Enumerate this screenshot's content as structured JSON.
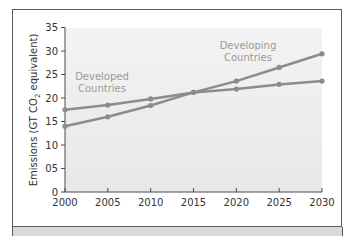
{
  "chart_data": {
    "type": "line",
    "title": "",
    "xlabel": "",
    "ylabel": "Emissions (GT CO₂ equivalent)",
    "ylabel_parts": {
      "prefix": "Emissions (GT CO",
      "sub": "2",
      "suffix": " equivalent)"
    },
    "x": [
      2000,
      2005,
      2010,
      2015,
      2020,
      2025,
      2030
    ],
    "x_tick_labels": [
      "2000",
      "2005",
      "2010",
      "2015",
      "2020",
      "2025",
      "2030"
    ],
    "y_ticks": [
      0,
      5,
      10,
      15,
      20,
      25,
      30,
      35
    ],
    "y_tick_labels": [
      "0",
      "05",
      "10",
      "15",
      "20",
      "25",
      "30",
      "35"
    ],
    "ylim": [
      0,
      35
    ],
    "xlim": [
      2000,
      2030
    ],
    "grid": false,
    "legend": "inline annotations",
    "series": [
      {
        "name": "Developed Countries",
        "label_lines": [
          "Developed",
          "Countries"
        ],
        "values": [
          17.5,
          18.5,
          19.8,
          21.2,
          21.9,
          22.9,
          23.6
        ],
        "color": "#8c8c8c"
      },
      {
        "name": "Developing Countries",
        "label_lines": [
          "Developing",
          "Countries"
        ],
        "values": [
          14.0,
          16.0,
          18.4,
          21.2,
          23.6,
          26.5,
          29.4
        ],
        "color": "#8c8c8c"
      }
    ]
  },
  "colors": {
    "plot_bg": "#ebebeb",
    "axis": "#4a4a4a",
    "line": "#8c8c8c",
    "label": "#9a9a9a"
  }
}
